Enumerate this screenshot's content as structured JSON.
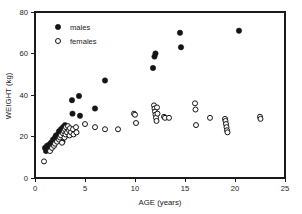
{
  "chart_data": {
    "type": "scatter",
    "title": "",
    "xlabel": "AGE (years)",
    "ylabel": "WEIGHT (kg)",
    "xlim": [
      0,
      25
    ],
    "ylim": [
      0,
      80
    ],
    "xticks": [
      0,
      5,
      10,
      15,
      20,
      25
    ],
    "yticks": [
      0,
      20,
      40,
      60,
      80
    ],
    "grid": false,
    "legend_position": "top-left",
    "series": [
      {
        "name": "males",
        "marker": "filled-circle",
        "color": "#151515",
        "points": [
          [
            1.0,
            14.5
          ],
          [
            1.1,
            13.0
          ],
          [
            1.2,
            15.5
          ],
          [
            1.3,
            13.5
          ],
          [
            1.4,
            16.0
          ],
          [
            1.5,
            14.0
          ],
          [
            1.6,
            17.0
          ],
          [
            1.7,
            15.0
          ],
          [
            1.8,
            18.5
          ],
          [
            1.9,
            16.5
          ],
          [
            2.0,
            19.5
          ],
          [
            2.05,
            17.5
          ],
          [
            2.1,
            20.5
          ],
          [
            2.2,
            18.0
          ],
          [
            2.3,
            21.0
          ],
          [
            2.35,
            19.0
          ],
          [
            2.4,
            22.5
          ],
          [
            2.5,
            20.0
          ],
          [
            2.6,
            23.5
          ],
          [
            2.7,
            21.5
          ],
          [
            2.75,
            17.5
          ],
          [
            2.8,
            24.5
          ],
          [
            2.9,
            22.0
          ],
          [
            3.0,
            25.5
          ],
          [
            3.05,
            23.0
          ],
          [
            3.1,
            20.5
          ],
          [
            3.2,
            24.0
          ],
          [
            3.3,
            22.5
          ],
          [
            3.7,
            37.5
          ],
          [
            3.75,
            31.0
          ],
          [
            4.4,
            39.5
          ],
          [
            4.5,
            30.0
          ],
          [
            6.0,
            33.5
          ],
          [
            7.0,
            47.0
          ],
          [
            11.8,
            53.0
          ],
          [
            11.95,
            58.5
          ],
          [
            12.05,
            60.0
          ],
          [
            14.5,
            70.0
          ],
          [
            14.6,
            63.0
          ],
          [
            20.4,
            71.0
          ]
        ]
      },
      {
        "name": "females",
        "marker": "open-circle",
        "color": "#151515",
        "points": [
          [
            0.9,
            8.0
          ],
          [
            1.5,
            13.0
          ],
          [
            1.7,
            14.5
          ],
          [
            1.9,
            15.5
          ],
          [
            2.0,
            16.5
          ],
          [
            2.2,
            17.5
          ],
          [
            2.4,
            18.5
          ],
          [
            2.5,
            19.5
          ],
          [
            2.6,
            20.5
          ],
          [
            2.7,
            17.0
          ],
          [
            2.8,
            21.5
          ],
          [
            2.9,
            22.5
          ],
          [
            2.95,
            19.5
          ],
          [
            3.0,
            23.5
          ],
          [
            3.05,
            21.0
          ],
          [
            3.1,
            24.5
          ],
          [
            3.2,
            22.0
          ],
          [
            3.3,
            25.0
          ],
          [
            3.4,
            23.0
          ],
          [
            3.45,
            20.5
          ],
          [
            3.5,
            24.0
          ],
          [
            3.6,
            22.0
          ],
          [
            3.8,
            23.5
          ],
          [
            3.85,
            21.0
          ],
          [
            4.1,
            24.5
          ],
          [
            4.15,
            22.0
          ],
          [
            5.0,
            26.0
          ],
          [
            6.0,
            24.5
          ],
          [
            7.0,
            23.5
          ],
          [
            8.3,
            23.5
          ],
          [
            9.9,
            31.0
          ],
          [
            10.0,
            30.5
          ],
          [
            10.1,
            26.5
          ],
          [
            11.9,
            35.0
          ],
          [
            11.95,
            33.5
          ],
          [
            12.0,
            32.0
          ],
          [
            12.05,
            30.5
          ],
          [
            12.1,
            29.0
          ],
          [
            12.15,
            27.5
          ],
          [
            12.2,
            34.0
          ],
          [
            12.25,
            31.0
          ],
          [
            12.9,
            29.5
          ],
          [
            13.0,
            29.0
          ],
          [
            13.4,
            29.0
          ],
          [
            16.0,
            36.0
          ],
          [
            16.05,
            33.0
          ],
          [
            16.1,
            25.5
          ],
          [
            17.5,
            29.0
          ],
          [
            19.0,
            28.5
          ],
          [
            19.05,
            27.5
          ],
          [
            19.1,
            26.0
          ],
          [
            19.15,
            24.5
          ],
          [
            19.2,
            23.0
          ],
          [
            19.25,
            22.0
          ],
          [
            22.5,
            29.5
          ],
          [
            22.55,
            28.5
          ]
        ]
      }
    ],
    "legend": [
      {
        "label": "males",
        "marker": "filled-circle"
      },
      {
        "label": "females",
        "marker": "open-circle"
      }
    ]
  }
}
